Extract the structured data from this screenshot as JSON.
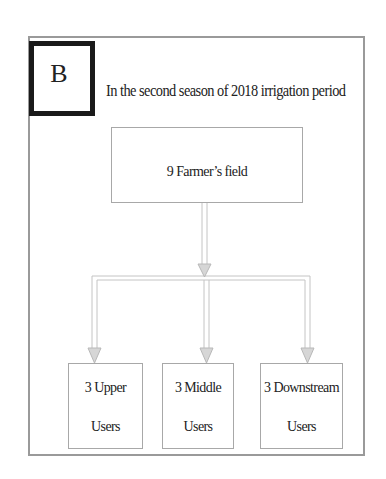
{
  "panel": {
    "label": "B",
    "title": "In the second season of 2018 irrigation period"
  },
  "nodes": {
    "root": {
      "text": "9 Farmer’s field"
    },
    "children": [
      {
        "line1": "3 Upper",
        "line2": "Users"
      },
      {
        "line1": "3 Middle",
        "line2": "Users"
      },
      {
        "line1": "3 Downstream",
        "line2": "Users"
      }
    ]
  },
  "edges": [
    {
      "from": "9 Farmer’s field",
      "to": "3 Upper Users"
    },
    {
      "from": "9 Farmer’s field",
      "to": "3 Middle Users"
    },
    {
      "from": "9 Farmer’s field",
      "to": "3 Downstream Users"
    }
  ],
  "colors": {
    "frame": "#9a9a9a",
    "label_border": "#1a1a1a",
    "arrow": "#c8c8c8"
  }
}
